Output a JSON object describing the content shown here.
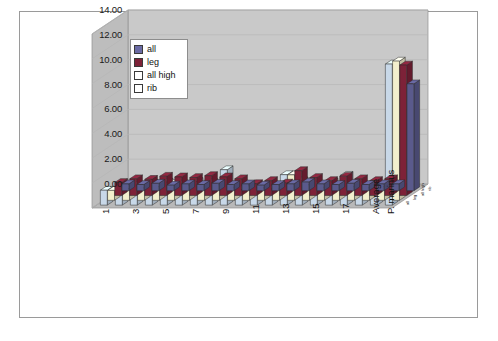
{
  "chart_data": {
    "type": "bar",
    "title": "",
    "xlabel": "",
    "ylabel": "",
    "ylim": [
      0,
      14
    ],
    "ytick_step": 2,
    "grid": true,
    "legend_position": "top-left-inside",
    "style": "excel-3d-clustered-column",
    "categories": [
      "1",
      "2",
      "3",
      "4",
      "5",
      "6",
      "7",
      "8",
      "9",
      "10",
      "11",
      "12",
      "13",
      "14",
      "15",
      "16",
      "17",
      "18",
      "Average",
      "P. marinus"
    ],
    "tick_labels_shown": [
      "1",
      "3",
      "5",
      "7",
      "9",
      "11",
      "13",
      "15",
      "17",
      "Average",
      "P. marinus"
    ],
    "depth_axis_labels": [
      "all",
      "leg",
      "all high",
      "rib"
    ],
    "series": [
      {
        "name": "all",
        "color": "#5a5a8c",
        "values": [
          0.55,
          0.5,
          0.6,
          0.45,
          0.55,
          0.5,
          0.6,
          0.5,
          0.55,
          0.45,
          0.5,
          0.55,
          0.7,
          0.55,
          0.5,
          0.6,
          0.5,
          0.55,
          0.55,
          8.6
        ]
      },
      {
        "name": "leg",
        "color": "#7d2238",
        "values": [
          1.05,
          1.35,
          1.3,
          1.55,
          1.5,
          1.45,
          1.6,
          1.5,
          1.35,
          0.95,
          1.2,
          1.0,
          2.0,
          1.45,
          1.2,
          1.55,
          1.35,
          1.2,
          1.35,
          10.5
        ]
      },
      {
        "name": "all high",
        "color": "#f2efcd",
        "values": [
          0.8,
          0.95,
          1.0,
          1.1,
          1.35,
          1.2,
          1.3,
          1.25,
          1.05,
          0.85,
          1.0,
          0.9,
          2.05,
          1.25,
          1.05,
          1.2,
          1.1,
          1.0,
          1.1,
          11.2
        ]
      },
      {
        "name": "rib",
        "color": "#c8d8e8",
        "values": [
          1.2,
          1.45,
          1.6,
          1.75,
          1.85,
          1.7,
          1.9,
          1.8,
          2.85,
          1.25,
          1.45,
          1.3,
          2.45,
          1.95,
          1.6,
          1.85,
          2.4,
          1.55,
          1.6,
          11.35
        ]
      }
    ],
    "ytick_labels": [
      "14.00",
      "12.00",
      "10.00",
      "8.00",
      "6.00",
      "4.00",
      "2.00",
      "0.00"
    ]
  },
  "legend": {
    "items": [
      {
        "label": "all",
        "color": "#6b6ba5"
      },
      {
        "label": "leg",
        "color": "#7d2238"
      },
      {
        "label": "all high",
        "color": "#ffffff"
      },
      {
        "label": "rib",
        "color": "#ffffff"
      }
    ]
  },
  "colors": {
    "wall_back": "#c9c9c9",
    "wall_side": "#bdbdbd",
    "floor": "#b9b9b9",
    "frame_border": "#9a9a9a",
    "gridline": "#b6b6b6",
    "text": "#111111"
  }
}
